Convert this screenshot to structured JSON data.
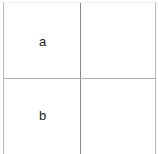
{
  "table": {
    "rows": [
      [
        "a",
        ""
      ],
      [
        "b",
        ""
      ]
    ]
  }
}
